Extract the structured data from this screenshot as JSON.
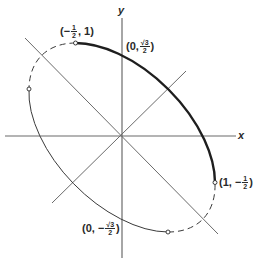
{
  "figure": {
    "type": "rotated-ellipse-diagram",
    "equation_implied": "x^2 + xy + y^2 = 3/4",
    "axes": {
      "x_label": "x",
      "y_label": "y"
    },
    "points": [
      {
        "id": "p1",
        "label_prefix": "(−",
        "num": "1",
        "den": "2",
        "label_suffix": ", 1)",
        "math": [
          -0.5,
          1
        ]
      },
      {
        "id": "p2",
        "label_prefix": "(0, ",
        "sqrt_num": "√3",
        "den": "2",
        "label_suffix": ")",
        "math": [
          0,
          0.866
        ]
      },
      {
        "id": "p3",
        "label_prefix": "(1, −",
        "num": "1",
        "den": "2",
        "label_suffix": ")",
        "math": [
          1,
          -0.5
        ]
      },
      {
        "id": "p4",
        "label_prefix": "(0, −",
        "sqrt_num": "√3",
        "den": "2",
        "label_suffix": ")",
        "math": [
          0,
          -0.866
        ]
      }
    ],
    "markers": [
      {
        "id": "left-marker",
        "math": [
          -1,
          0.5
        ]
      },
      {
        "id": "bottom-marker",
        "math": [
          0.5,
          -1
        ]
      }
    ],
    "segments": {
      "highlighted_arc": "from (−1/2, 1) through (0, √3/2) to (1, −1/2)",
      "dashed_arcs": [
        "from (−1/2, 1) to (−1, 1/2)",
        "from (1/2, −1) to (1, −1/2)"
      ],
      "thin_arc": "from (−1, 1/2) to (1/2, −1)"
    },
    "colors": {
      "ink": "#2a2a2a",
      "axis": "#6b6b6b",
      "background": "#ffffff"
    }
  }
}
